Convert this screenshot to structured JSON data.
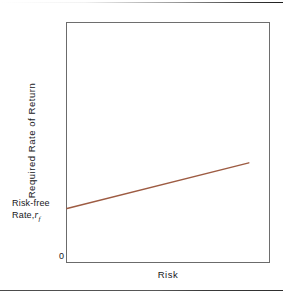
{
  "figure": {
    "background_color": "#ffffff",
    "rule_color": "#4a4a4a"
  },
  "axes": {
    "frame_color": "#6e6e6e",
    "y_label": "Required Rate of Return",
    "x_label": "Risk",
    "origin_label": "0"
  },
  "annotations": {
    "intercept_line1": "Risk-free",
    "intercept_line2_text": "Rate,",
    "intercept_symbol": "r",
    "intercept_subscript": "f"
  },
  "chart_data": {
    "type": "line",
    "title": "",
    "subtitle": "",
    "xlabel": "Risk",
    "ylabel": "Required Rate of Return",
    "xlim": [
      0,
      1
    ],
    "ylim": [
      0,
      1
    ],
    "grid": false,
    "legend": "none",
    "line_color": "#9d5b42",
    "series": [
      {
        "name": "Security Market Line",
        "x": [
          0.0,
          0.9
        ],
        "y": [
          0.224,
          0.415
        ]
      }
    ],
    "tick_labels": {
      "x": [],
      "y": [
        "0"
      ]
    },
    "annotations": [
      {
        "text": "Risk-free Rate, r_f",
        "x": 0.0,
        "y": 0.224,
        "position": "left-of-axis"
      }
    ]
  }
}
